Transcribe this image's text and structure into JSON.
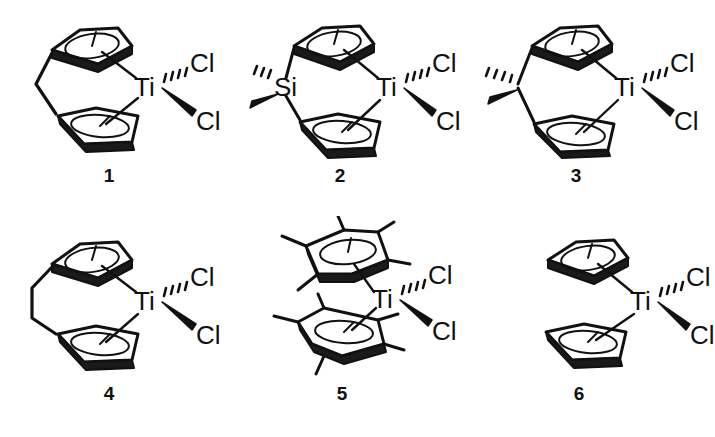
{
  "figure": {
    "type": "chemical-structure-series",
    "background_color": "#ffffff",
    "ink_color": "#111111",
    "rows": 2,
    "columns": 3
  },
  "structures": [
    {
      "id": "1",
      "label": "1",
      "name": "ethylene-bridged ansa-titanocene dichloride",
      "metal": "Ti",
      "bridge": "ethylene (CH2CH2)",
      "bridge_vertices": 1,
      "rings": [
        "cyclopentadienyl",
        "cyclopentadienyl"
      ],
      "ring_substituents": 0,
      "ligands": [
        {
          "label": "Cl",
          "bond": "hashed-wedge",
          "position": "upper"
        },
        {
          "label": "Cl",
          "bond": "solid-wedge",
          "position": "lower"
        }
      ]
    },
    {
      "id": "2",
      "label": "2",
      "name": "dimethylsilylene-bridged ansa-titanocene dichloride",
      "metal": "Ti",
      "bridge": "Si",
      "bridge_atom_label": "Si",
      "bridge_substituents": [
        {
          "bond": "hashed-wedge",
          "position": "upper-left"
        },
        {
          "bond": "solid-wedge",
          "position": "lower-left"
        }
      ],
      "rings": [
        "cyclopentadienyl",
        "cyclopentadienyl"
      ],
      "ring_substituents": 0,
      "ligands": [
        {
          "label": "Cl",
          "bond": "hashed-wedge",
          "position": "upper"
        },
        {
          "label": "Cl",
          "bond": "solid-wedge",
          "position": "lower"
        }
      ]
    },
    {
      "id": "3",
      "label": "3",
      "name": "isopropylidene-bridged ansa-titanocene dichloride",
      "metal": "Ti",
      "bridge": "C",
      "bridge_atom_label": "",
      "bridge_substituents": [
        {
          "bond": "hashed-wedge",
          "position": "upper-left"
        },
        {
          "bond": "solid-wedge",
          "position": "lower-left"
        }
      ],
      "rings": [
        "cyclopentadienyl",
        "cyclopentadienyl"
      ],
      "ring_substituents": 0,
      "ligands": [
        {
          "label": "Cl",
          "bond": "hashed-wedge",
          "position": "upper"
        },
        {
          "label": "Cl",
          "bond": "solid-wedge",
          "position": "lower"
        }
      ]
    },
    {
      "id": "4",
      "label": "4",
      "name": "trimethylene-bridged ansa-titanocene dichloride",
      "metal": "Ti",
      "bridge": "trimethylene (CH2CH2CH2)",
      "bridge_vertices": 2,
      "rings": [
        "cyclopentadienyl",
        "cyclopentadienyl"
      ],
      "ring_substituents": 0,
      "ligands": [
        {
          "label": "Cl",
          "bond": "hashed-wedge",
          "position": "upper"
        },
        {
          "label": "Cl",
          "bond": "solid-wedge",
          "position": "lower"
        }
      ]
    },
    {
      "id": "5",
      "label": "5",
      "name": "decamethyltitanocene dichloride",
      "metal": "Ti",
      "bridge": "none",
      "rings": [
        "pentamethylcyclopentadienyl",
        "pentamethylcyclopentadienyl"
      ],
      "ring_substituents": 5,
      "ligands": [
        {
          "label": "Cl",
          "bond": "hashed-wedge",
          "position": "upper"
        },
        {
          "label": "Cl",
          "bond": "solid-wedge",
          "position": "lower"
        }
      ]
    },
    {
      "id": "6",
      "label": "6",
      "name": "titanocene dichloride",
      "metal": "Ti",
      "bridge": "none",
      "rings": [
        "cyclopentadienyl",
        "cyclopentadienyl"
      ],
      "ring_substituents": 0,
      "ligands": [
        {
          "label": "Cl",
          "bond": "hashed-wedge",
          "position": "upper"
        },
        {
          "label": "Cl",
          "bond": "solid-wedge",
          "position": "lower"
        }
      ]
    }
  ]
}
